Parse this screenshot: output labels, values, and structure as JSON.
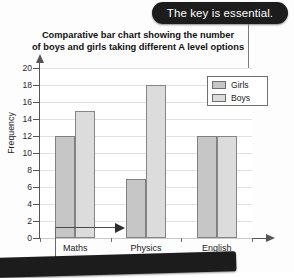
{
  "annotation": {
    "callout_text": "The key is essential.",
    "callout_bg": "#1c1c1c",
    "callout_color": "#ffffff",
    "pointer_arrow_icon": "left-arrow-icon",
    "origin_arrow_icon": "right-arrow-icon"
  },
  "legend": {
    "position": "top-right",
    "entries": [
      {
        "label": "Girls",
        "color": "#c6c6c6"
      },
      {
        "label": "Boys",
        "color": "#dcdcdc"
      }
    ]
  },
  "axes": {
    "y_title": "Frequency",
    "y_ticks": [
      "0",
      "2",
      "4",
      "6",
      "8",
      "10",
      "12",
      "14",
      "16",
      "18",
      "20"
    ],
    "x_categories": [
      "Maths",
      "Physics",
      "English"
    ]
  },
  "chart_data": {
    "type": "bar",
    "title": "Comparative bar chart showing the number of boys and girls taking different A level options",
    "title_line1": "Comparative bar chart showing the number",
    "title_line2": "of boys and girls taking different A level options",
    "categories": [
      "Maths",
      "Physics",
      "English"
    ],
    "series": [
      {
        "name": "Girls",
        "values": [
          12,
          7,
          12
        ],
        "color": "#c6c6c6"
      },
      {
        "name": "Boys",
        "values": [
          15,
          18,
          12
        ],
        "color": "#dcdcdc"
      }
    ],
    "xlabel": "",
    "ylabel": "Frequency",
    "ylim": [
      0,
      20
    ],
    "ytick_step": 2,
    "grid": true,
    "grid_axis": "y",
    "legend_position": "top-right",
    "annotations": [
      "The key is essential."
    ]
  }
}
